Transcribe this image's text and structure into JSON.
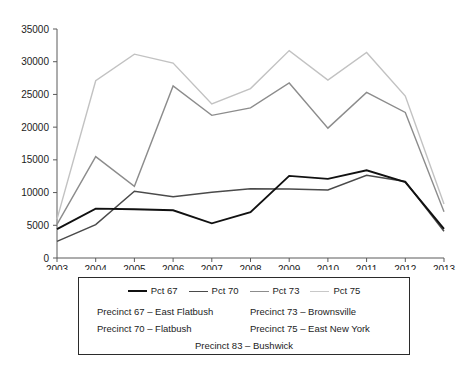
{
  "chart_data": {
    "type": "line",
    "title": "",
    "xlabel": "",
    "ylabel": "",
    "categories": [
      2003,
      2004,
      2005,
      2006,
      2007,
      2008,
      2009,
      2010,
      2011,
      2012,
      2013
    ],
    "xtick_labels": [
      "2003",
      "2004",
      "2005",
      "2006",
      "2007",
      "2008",
      "2009",
      "2010",
      "2011",
      "2012",
      "2013"
    ],
    "ytick_labels": [
      "0",
      "5000",
      "10000",
      "15000",
      "20000",
      "25000",
      "30000",
      "35000"
    ],
    "ytick_values": [
      0,
      5000,
      10000,
      15000,
      20000,
      25000,
      30000,
      35000
    ],
    "ylim": [
      0,
      35000
    ],
    "grid": false,
    "legend_position": "bottom",
    "series": [
      {
        "name": "Pct 67",
        "color": "#111111",
        "width": 1.9,
        "values": [
          4400,
          7550,
          7450,
          7300,
          5300,
          7000,
          12550,
          12100,
          13400,
          11600,
          4450
        ]
      },
      {
        "name": "Pct 70",
        "color": "#4a4a4a",
        "width": 1.5,
        "values": [
          2550,
          5100,
          10200,
          9350,
          10050,
          10600,
          10550,
          10400,
          12650,
          11700,
          4100
        ]
      },
      {
        "name": "Pct 73",
        "color": "#8c8c8c",
        "width": 1.4,
        "values": [
          5150,
          15500,
          10950,
          26300,
          21800,
          22950,
          26750,
          19850,
          25300,
          22250,
          7050
        ]
      },
      {
        "name": "Pct 75",
        "color": "#c2c2c2",
        "width": 1.4,
        "values": [
          5950,
          27100,
          31150,
          29800,
          23550,
          25900,
          31700,
          27200,
          31400,
          24750,
          8250
        ]
      }
    ]
  },
  "legend": {
    "series_entries": [
      {
        "label": "Pct 67",
        "color": "#111111",
        "width": 2.2
      },
      {
        "label": "Pct 70",
        "color": "#4a4a4a",
        "width": 1.8
      },
      {
        "label": "Pct 73",
        "color": "#8c8c8c",
        "width": 1.6
      },
      {
        "label": "Pct 75",
        "color": "#c8c8c8",
        "width": 1.6
      }
    ],
    "name_rows": [
      {
        "left": "Precinct 67 – East Flatbush",
        "right": "Precinct 73 – Brownsville"
      },
      {
        "left": "Precinct 70 – Flatbush",
        "right": "Precinct 75 – East New York"
      }
    ],
    "center_row": "Precinct 83 – Bushwick"
  }
}
